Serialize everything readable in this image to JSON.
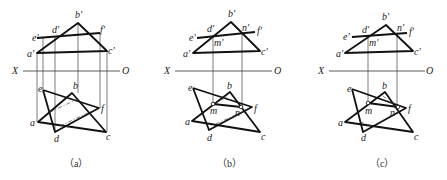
{
  "figure": {
    "panels": [
      {
        "id": "a",
        "caption": "（a）",
        "axis": {
          "left_label": "X",
          "right_label": "O"
        },
        "front_labels": {
          "a": "a'",
          "b": "b'",
          "c": "c'",
          "d": "d'",
          "e": "e'",
          "f": "f'"
        },
        "top_labels": {
          "a": "a",
          "b": "b",
          "c": "c",
          "d": "d",
          "e": "e",
          "f": "f"
        }
      },
      {
        "id": "b",
        "caption": "（b）",
        "axis": {
          "left_label": "X",
          "right_label": "O"
        },
        "front_labels": {
          "a": "a'",
          "b": "b'",
          "c": "c'",
          "d": "d'",
          "e": "e'",
          "f": "f'",
          "m": "m'",
          "n": "n'"
        },
        "top_labels": {
          "a": "a",
          "b": "b",
          "c": "c",
          "d": "d",
          "e": "e",
          "f": "f",
          "m": "m",
          "n": "n"
        }
      },
      {
        "id": "c",
        "caption": "（c）",
        "axis": {
          "left_label": "X",
          "right_label": "O"
        },
        "front_labels": {
          "a": "a'",
          "b": "b'",
          "c": "c'",
          "d": "d'",
          "e": "e'",
          "f": "f'",
          "m": "m'",
          "n": "n'"
        },
        "top_labels": {
          "a": "a",
          "b": "b",
          "c": "c",
          "d": "d",
          "e": "e",
          "f": "f",
          "m": "m",
          "n": "n"
        }
      }
    ]
  }
}
